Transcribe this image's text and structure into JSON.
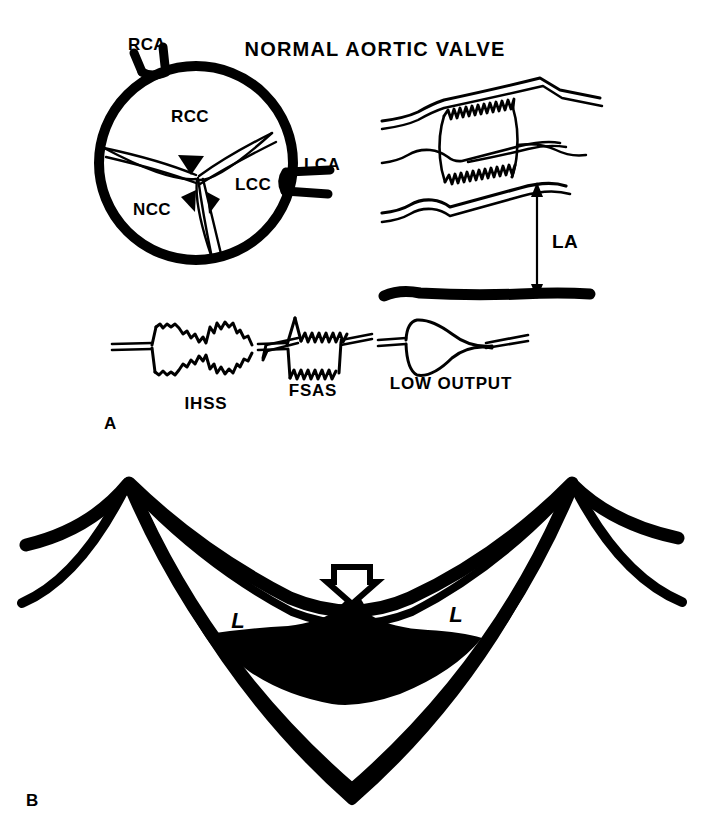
{
  "figure": {
    "title": "NORMAL AORTIC VALVE",
    "background_color": "#ffffff",
    "ink_color": "#000000",
    "panels": [
      {
        "id": "A",
        "label": "A"
      },
      {
        "id": "B",
        "label": "B"
      }
    ]
  },
  "panel_a": {
    "short_axis": {
      "caption": "NORMAL AORTIC VALVE",
      "cusps": [
        {
          "abbr": "RCC",
          "name": "right coronary cusp"
        },
        {
          "abbr": "NCC",
          "name": "non-coronary cusp"
        },
        {
          "abbr": "LCC",
          "name": "left coronary cusp"
        }
      ],
      "arteries": [
        {
          "abbr": "RCA",
          "name": "right coronary artery"
        },
        {
          "abbr": "LCA",
          "name": "left coronary artery"
        }
      ]
    },
    "m_mode": {
      "measurement_label": "LA",
      "measurement_name": "left atrium dimension"
    },
    "tracings": [
      {
        "label": "IHSS",
        "name": "idiopathic hypertrophic subaortic stenosis"
      },
      {
        "label": "FSAS",
        "name": "fixed subaortic stenosis"
      },
      {
        "label": "LOW OUTPUT",
        "name": "low cardiac output"
      }
    ]
  },
  "panel_b": {
    "leaflet_labels": [
      "L",
      "L"
    ],
    "arrow_label": "",
    "arrow_name": "down-arrow-marker"
  }
}
